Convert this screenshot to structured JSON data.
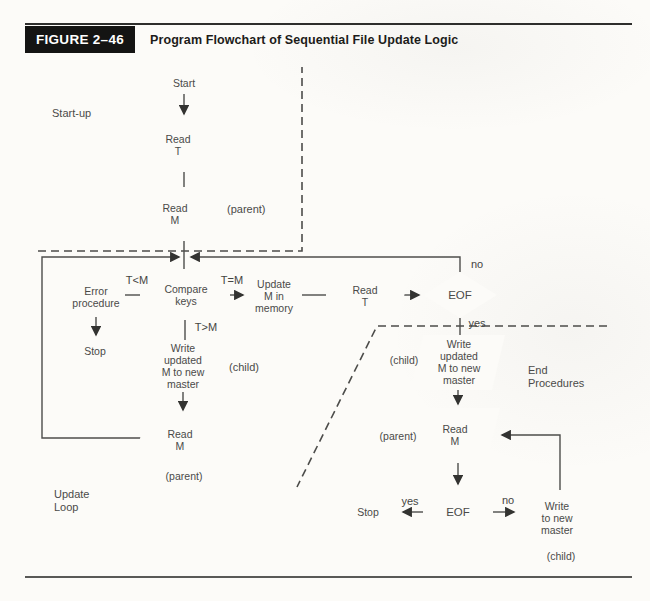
{
  "header": {
    "figure_label": "FIGURE 2–46",
    "title": "Program Flowchart of Sequential File Update Logic"
  },
  "sections": {
    "startup": "Start-up",
    "update_loop": "Update\nLoop",
    "end_procedures": "End\nProcedures"
  },
  "nodes": {
    "start": "Start",
    "read_t_startup": "Read\nT",
    "read_m_startup": "Read\nM",
    "error_procedure": "Error\nprocedure",
    "compare_keys": "Compare\nkeys",
    "update_m_in_memory": "Update\nM in\nmemory",
    "read_t_loop": "Read\nT",
    "eof_loop": "EOF",
    "stop_loop": "Stop",
    "write_updated_loop": "Write\nupdated\nM to new\nmaster",
    "read_m_loop": "Read\nM",
    "write_updated_end": "Write\nupdated\nM to new\nmaster",
    "read_m_end": "Read\nM",
    "eof_end": "EOF",
    "stop_end": "Stop",
    "write_to_new_master": "Write\nto new\nmaster"
  },
  "edge_labels": {
    "t_lt_m": "T<M",
    "t_eq_m": "T=M",
    "t_gt_m": "T>M",
    "no_loop": "no",
    "yes_loop": "yes",
    "yes_end": "yes",
    "no_end": "no"
  },
  "annotations": {
    "parent_startup": "(parent)",
    "child_loop": "(child)",
    "parent_loop": "(parent)",
    "child_end": "(child)",
    "parent_end": "(parent)",
    "child_write": "(child)"
  },
  "colors": {
    "line": "#4d4d4b",
    "arrow": "#333331",
    "text": "#4a4a48",
    "header_bg": "#141413",
    "header_text": "#ffffff",
    "page_bg": "#fcfbf8"
  }
}
